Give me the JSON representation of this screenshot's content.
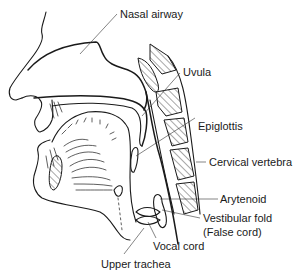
{
  "figure": {
    "labels": [
      {
        "id": "nasal-airway",
        "text": "Nasal airway"
      },
      {
        "id": "uvula",
        "text": "Uvula"
      },
      {
        "id": "epiglottis",
        "text": "Epiglottis"
      },
      {
        "id": "cervical-vertebra",
        "text": "Cervical vertebra"
      },
      {
        "id": "arytenoid",
        "text": "Arytenoid"
      },
      {
        "id": "vestibular-fold",
        "text": "Vestibular fold"
      },
      {
        "id": "false-cord",
        "text": "(False cord)"
      },
      {
        "id": "vocal-cord",
        "text": "Vocal cord"
      },
      {
        "id": "upper-trachea",
        "text": "Upper trachea"
      }
    ]
  }
}
